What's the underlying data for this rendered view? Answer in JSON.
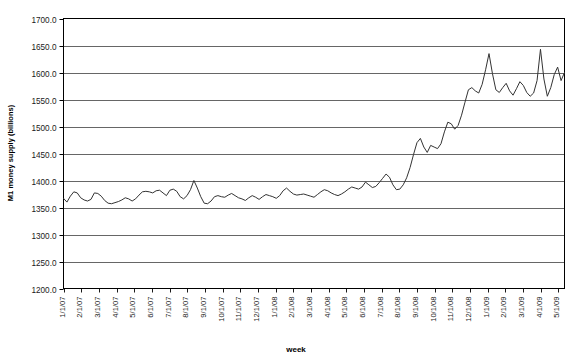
{
  "chart_data": {
    "type": "line",
    "title": "",
    "xlabel": "week",
    "ylabel": "M1 money supply (billions)",
    "ylim": [
      1200.0,
      1700.0
    ],
    "ytick_step": 50.0,
    "ytick_labels": [
      "1700.0",
      "1650.0",
      "1600.0",
      "1550.0",
      "1500.0",
      "1450.0",
      "1400.0",
      "1350.0",
      "1300.0",
      "1250.0",
      "1200.0"
    ],
    "ytick_values": [
      1700.0,
      1650.0,
      1600.0,
      1550.0,
      1500.0,
      1450.0,
      1400.0,
      1350.0,
      1300.0,
      1250.0,
      1200.0
    ],
    "grid": true,
    "legend": false,
    "line_color": "#333333",
    "axis_color": "#000000",
    "grid_color": "#555555",
    "plot_background": "#ffffff",
    "xtick_labels": [
      "1/1/07",
      "2/1/07",
      "3/1/07",
      "4/1/07",
      "5/1/07",
      "6/1/07",
      "7/1/07",
      "8/1/07",
      "9/1/07",
      "10/1/07",
      "11/1/07",
      "12/1/07",
      "1/1/08",
      "2/1/08",
      "3/1/08",
      "4/1/08",
      "5/1/08",
      "6/1/08",
      "7/1/08",
      "8/1/08",
      "9/1/08",
      "10/1/08",
      "11/1/08",
      "12/1/08",
      "1/1/09",
      "2/1/09",
      "3/1/09",
      "4/1/09",
      "5/1/09"
    ],
    "x_unit": "week",
    "x_start": "1/1/07",
    "x_end": "5/1/09",
    "series": [
      {
        "name": "M1 money supply",
        "values": [
          1367,
          1360,
          1371,
          1379,
          1377,
          1368,
          1364,
          1362,
          1365,
          1377,
          1376,
          1371,
          1363,
          1358,
          1357,
          1359,
          1361,
          1364,
          1368,
          1366,
          1362,
          1366,
          1373,
          1379,
          1380,
          1379,
          1377,
          1381,
          1382,
          1377,
          1372,
          1382,
          1384,
          1380,
          1370,
          1366,
          1372,
          1383,
          1400,
          1386,
          1370,
          1358,
          1357,
          1362,
          1370,
          1372,
          1370,
          1369,
          1373,
          1376,
          1372,
          1368,
          1366,
          1363,
          1368,
          1372,
          1369,
          1365,
          1370,
          1374,
          1372,
          1370,
          1367,
          1372,
          1381,
          1386,
          1380,
          1375,
          1373,
          1374,
          1375,
          1373,
          1371,
          1369,
          1374,
          1379,
          1383,
          1381,
          1377,
          1374,
          1372,
          1375,
          1379,
          1384,
          1388,
          1386,
          1384,
          1388,
          1397,
          1392,
          1387,
          1389,
          1396,
          1404,
          1412,
          1406,
          1392,
          1383,
          1384,
          1392,
          1405,
          1424,
          1448,
          1470,
          1478,
          1462,
          1452,
          1465,
          1462,
          1459,
          1468,
          1490,
          1508,
          1505,
          1495,
          1502,
          1521,
          1545,
          1568,
          1572,
          1566,
          1562,
          1578,
          1605,
          1635,
          1598,
          1568,
          1563,
          1572,
          1580,
          1566,
          1558,
          1570,
          1583,
          1576,
          1563,
          1556,
          1562,
          1585,
          1643,
          1588,
          1556,
          1572,
          1596,
          1610,
          1585,
          1600
        ]
      }
    ]
  },
  "axis": {
    "y_title": "M1 money supply (billions)",
    "x_title": "week"
  }
}
